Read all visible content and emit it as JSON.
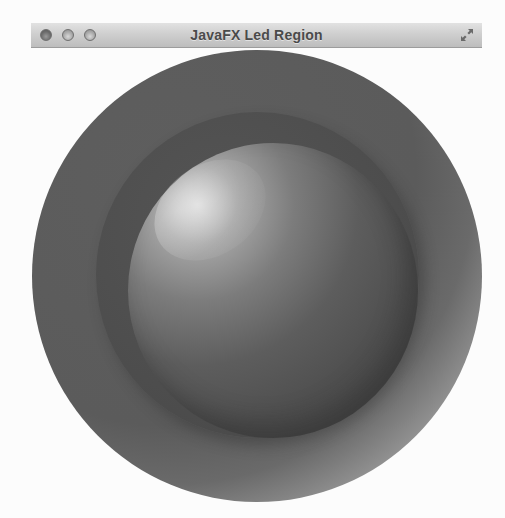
{
  "window": {
    "title": "JavaFX Led Region",
    "controls": {
      "close": "close-button",
      "minimize": "minimize-button",
      "zoom": "zoom-button",
      "fullscreen": "fullscreen-button"
    }
  },
  "content": {
    "led": {
      "state": "off",
      "colors": {
        "shadow_ring": "#5e5e5e",
        "frame": "#4d4d4d",
        "main": "#5d5d5d",
        "highlight": "#d9d9d9",
        "background": "#fcfcfc",
        "titlebar_top": "#e2e2e2",
        "titlebar_bottom": "#bdbdbd"
      }
    }
  }
}
